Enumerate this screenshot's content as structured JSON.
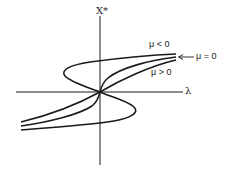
{
  "diagram": {
    "type": "bifurcation-diagram",
    "axes": {
      "vertical_label": "X*",
      "horizontal_label": "λ"
    },
    "curves": [
      {
        "id": "mu-negative",
        "label": "μ < 0",
        "shape": "S-shaped with fold (hysteresis)"
      },
      {
        "id": "mu-zero",
        "label": "μ = 0",
        "shape": "monotone, vertical tangent at origin"
      },
      {
        "id": "mu-positive",
        "label": "μ > 0",
        "shape": "monotone, smooth through origin"
      }
    ],
    "annotations": {
      "mu_zero_arrow": "←"
    },
    "colors": {
      "ink": "#1a1a1a",
      "background": "#ffffff"
    }
  }
}
